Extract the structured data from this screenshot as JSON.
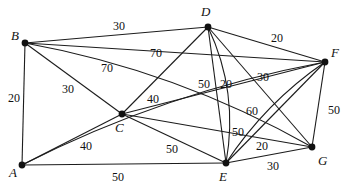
{
  "graph": {
    "type": "weighted-undirected-graph",
    "title": "",
    "nodes": [
      {
        "id": "A",
        "label": "A",
        "x": 22,
        "y": 165,
        "label_x": 9,
        "label_y": 166
      },
      {
        "id": "B",
        "label": "B",
        "x": 25,
        "y": 43,
        "label_x": 11,
        "label_y": 29
      },
      {
        "id": "C",
        "label": "C",
        "x": 122,
        "y": 114,
        "label_x": 115,
        "label_y": 121
      },
      {
        "id": "D",
        "label": "D",
        "x": 208,
        "y": 27,
        "label_x": 201,
        "label_y": 5
      },
      {
        "id": "E",
        "label": "E",
        "x": 226,
        "y": 163,
        "label_x": 219,
        "label_y": 170
      },
      {
        "id": "F",
        "label": "F",
        "x": 325,
        "y": 62,
        "label_x": 331,
        "label_y": 46
      },
      {
        "id": "G",
        "label": "G",
        "x": 312,
        "y": 147,
        "label_x": 318,
        "label_y": 154
      }
    ],
    "edges": [
      {
        "from": "A",
        "to": "B",
        "weight": 20,
        "curve": 0,
        "label_x": 8,
        "label_y": 92
      },
      {
        "from": "B",
        "to": "D",
        "weight": 30,
        "curve": 0,
        "label_x": 113,
        "label_y": 20
      },
      {
        "from": "B",
        "to": "F",
        "weight": 70,
        "curve": 0,
        "label_x": 150,
        "label_y": 47
      },
      {
        "from": "B",
        "to": "G",
        "weight": 70,
        "curve": -26,
        "label_x": 101,
        "label_y": 62
      },
      {
        "from": "B",
        "to": "C",
        "weight": 30,
        "curve": 0,
        "label_x": 62,
        "label_y": 83
      },
      {
        "from": "A",
        "to": "C",
        "weight": 40,
        "curve": 0,
        "label_x": 80,
        "label_y": 140
      },
      {
        "from": "A",
        "to": "E",
        "weight": 50,
        "curve": 0,
        "label_x": 112,
        "label_y": 171
      },
      {
        "from": "A",
        "to": "F",
        "weight": 60,
        "curve": -23,
        "label_x": 246,
        "label_y": 105
      },
      {
        "from": "C",
        "to": "D",
        "weight": 40,
        "curve": 0,
        "label_x": 147,
        "label_y": 93
      },
      {
        "from": "C",
        "to": "F",
        "weight": 0,
        "curve": 0,
        "label_x": null,
        "label_y": null
      },
      {
        "from": "C",
        "to": "G",
        "weight": 0,
        "curve": 0,
        "label_x": null,
        "label_y": null
      },
      {
        "from": "C",
        "to": "E",
        "weight": 50,
        "curve": 0,
        "label_x": 166,
        "label_y": 143
      },
      {
        "from": "D",
        "to": "E",
        "weight": 50,
        "curve": -22,
        "label_x": 198,
        "label_y": 78
      },
      {
        "from": "D",
        "to": "E",
        "weight": 20,
        "curve": 0,
        "label_x": 220,
        "label_y": 78
      },
      {
        "from": "D",
        "to": "F",
        "weight": 20,
        "curve": 0,
        "label_x": 271,
        "label_y": 32
      },
      {
        "from": "D",
        "to": "G",
        "weight": 30,
        "curve": 0,
        "label_x": 257,
        "label_y": 71
      },
      {
        "from": "E",
        "to": "F",
        "weight": 50,
        "curve": -14,
        "label_x": 232,
        "label_y": 126
      },
      {
        "from": "E",
        "to": "F",
        "weight": 20,
        "curve": 0,
        "label_x": 256,
        "label_y": 140
      },
      {
        "from": "E",
        "to": "G",
        "weight": 30,
        "curve": 0,
        "label_x": 267,
        "label_y": 160
      },
      {
        "from": "F",
        "to": "G",
        "weight": 50,
        "curve": 0,
        "label_x": 328,
        "label_y": 104
      }
    ],
    "weight_labels": [
      {
        "text": "20",
        "x": 8,
        "y": 92
      },
      {
        "text": "30",
        "x": 113,
        "y": 20
      },
      {
        "text": "70",
        "x": 150,
        "y": 47
      },
      {
        "text": "70",
        "x": 101,
        "y": 62
      },
      {
        "text": "30",
        "x": 62,
        "y": 83
      },
      {
        "text": "40",
        "x": 80,
        "y": 140
      },
      {
        "text": "50",
        "x": 112,
        "y": 171
      },
      {
        "text": "60",
        "x": 246,
        "y": 105
      },
      {
        "text": "40",
        "x": 147,
        "y": 93
      },
      {
        "text": "50",
        "x": 166,
        "y": 143
      },
      {
        "text": "50",
        "x": 198,
        "y": 78
      },
      {
        "text": "20",
        "x": 220,
        "y": 78
      },
      {
        "text": "20",
        "x": 271,
        "y": 32
      },
      {
        "text": "30",
        "x": 257,
        "y": 71
      },
      {
        "text": "50",
        "x": 232,
        "y": 126
      },
      {
        "text": "20",
        "x": 256,
        "y": 140
      },
      {
        "text": "30",
        "x": 267,
        "y": 160
      },
      {
        "text": "50",
        "x": 328,
        "y": 104
      }
    ],
    "style": {
      "edge_color": "#1c1c1c",
      "node_color": "#111111",
      "background": "#ffffff",
      "node_radius": 3.4,
      "edge_width": 1.1
    }
  }
}
